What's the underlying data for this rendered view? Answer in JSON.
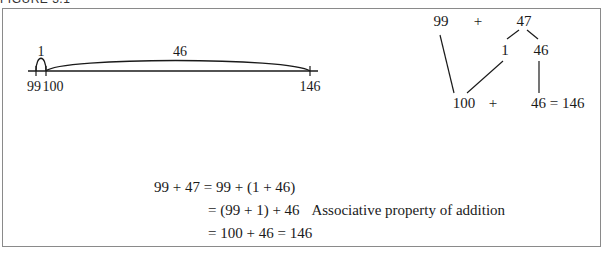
{
  "figure": {
    "caption": "FIGURE 3.1"
  },
  "number_line": {
    "jump_small_label": "1",
    "jump_large_label": "46",
    "ticks": [
      {
        "label": "99",
        "x": 36
      },
      {
        "label": "100",
        "x": 46
      },
      {
        "label": "146",
        "x": 310
      }
    ]
  },
  "decomposition_tree": {
    "top_left": "99",
    "top_plus": "+",
    "top_right": "47",
    "split_left": "1",
    "split_right": "46",
    "bottom_left": "100",
    "bottom_plus": "+",
    "bottom_right": "46 = 146"
  },
  "equations": [
    {
      "lhs": "99 + 47",
      "rhs": "= 99 + (1 + 46)",
      "note": ""
    },
    {
      "lhs": "",
      "rhs": "= (99 + 1) + 46",
      "note": "Associative property of addition"
    },
    {
      "lhs": "",
      "rhs": "= 100 + 46 = 146",
      "note": ""
    }
  ]
}
